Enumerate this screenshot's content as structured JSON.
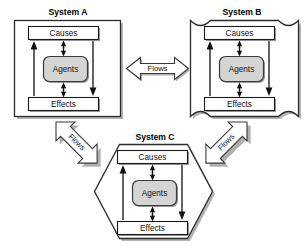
{
  "diagram": {
    "title_a": "System A",
    "title_b": "System B",
    "title_c": "System C",
    "node_causes": "Causes",
    "node_agents": "Agents",
    "node_effects": "Effects",
    "flow_ab": "Flows",
    "flow_ac": "Flows",
    "flow_bc": "Flows",
    "systems": [
      {
        "id": "A",
        "title": "System A",
        "shape": "rectangle",
        "nodes": [
          {
            "name": "Causes",
            "type": "box"
          },
          {
            "name": "Agents",
            "type": "rounded-box-shaded"
          },
          {
            "name": "Effects",
            "type": "box"
          }
        ],
        "internal_arrows": [
          {
            "from": "Effects",
            "to": "Causes",
            "style": "single-head-up"
          },
          {
            "from": "Causes",
            "to": "Effects",
            "style": "single-head-down"
          },
          {
            "from": "Causes",
            "to": "Agents",
            "style": "double-head-vertical"
          },
          {
            "from": "Agents",
            "to": "Effects",
            "style": "double-head-vertical"
          }
        ]
      },
      {
        "id": "B",
        "title": "System B",
        "shape": "concave-corner-square",
        "nodes": [
          {
            "name": "Causes",
            "type": "box"
          },
          {
            "name": "Agents",
            "type": "rounded-box-shaded"
          },
          {
            "name": "Effects",
            "type": "box"
          }
        ],
        "internal_arrows": [
          {
            "from": "Effects",
            "to": "Causes",
            "style": "single-head-up"
          },
          {
            "from": "Causes",
            "to": "Effects",
            "style": "single-head-down"
          },
          {
            "from": "Causes",
            "to": "Agents",
            "style": "double-head-vertical"
          },
          {
            "from": "Agents",
            "to": "Effects",
            "style": "double-head-vertical"
          }
        ]
      },
      {
        "id": "C",
        "title": "System C",
        "shape": "hexagon",
        "nodes": [
          {
            "name": "Causes",
            "type": "box"
          },
          {
            "name": "Agents",
            "type": "rounded-box-shaded"
          },
          {
            "name": "Effects",
            "type": "box"
          }
        ],
        "internal_arrows": [
          {
            "from": "Effects",
            "to": "Causes",
            "style": "single-head-up"
          },
          {
            "from": "Causes",
            "to": "Effects",
            "style": "single-head-down"
          },
          {
            "from": "Causes",
            "to": "Agents",
            "style": "double-head-vertical"
          },
          {
            "from": "Agents",
            "to": "Effects",
            "style": "double-head-vertical"
          }
        ]
      }
    ],
    "connectors": [
      {
        "label": "Flows",
        "between": [
          "System A",
          "System B"
        ],
        "orientation": "horizontal",
        "double_headed": true
      },
      {
        "label": "Flows",
        "between": [
          "System A",
          "System C"
        ],
        "orientation": "diagonal-down-right",
        "double_headed": true
      },
      {
        "label": "Flows",
        "between": [
          "System B",
          "System C"
        ],
        "orientation": "diagonal-down-left",
        "double_headed": true
      }
    ]
  },
  "colors": {
    "background": "#ffffff",
    "outline": "#2b2b2b",
    "shadow": "#9a9a9a",
    "agents_fill": "#d4d4d4",
    "text": "#111111",
    "arrow": "#111111"
  }
}
